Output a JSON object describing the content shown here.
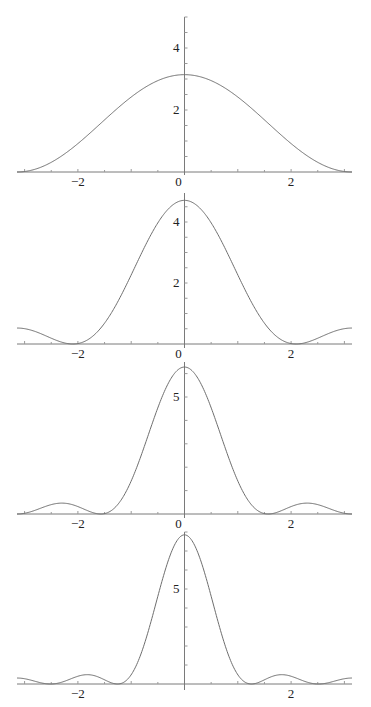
{
  "chart_data": [
    {
      "type": "line",
      "title": "",
      "xlabel": "",
      "ylabel": "",
      "n": 2,
      "peak": 3.14,
      "xlim": [
        -3.1416,
        3.1416
      ],
      "ylim": [
        0,
        5
      ],
      "xticks": [
        -2,
        0,
        2
      ],
      "xtick_labels": [
        "−2",
        "0",
        "2"
      ],
      "yticks": [
        2,
        4
      ],
      "ytick_labels": [
        "2",
        "4"
      ],
      "minor_ystep": 0.5,
      "grid": false,
      "x": [
        -3.14,
        -2.5,
        -2,
        -1.5,
        -1,
        -0.5,
        0,
        0.5,
        1,
        1.5,
        2,
        2.5,
        3.14
      ],
      "y": [
        0,
        0.3,
        0.92,
        1.86,
        2.3,
        2.96,
        3.14,
        2.96,
        2.3,
        1.86,
        0.92,
        0.3,
        0
      ]
    },
    {
      "type": "line",
      "title": "",
      "xlabel": "",
      "ylabel": "",
      "n": 3,
      "peak": 4.71,
      "xlim": [
        -3.1416,
        3.1416
      ],
      "ylim": [
        0,
        5
      ],
      "xticks": [
        -2,
        0,
        2
      ],
      "xtick_labels": [
        "−2",
        "0",
        "2"
      ],
      "yticks": [
        2,
        4
      ],
      "ytick_labels": [
        "2",
        "4"
      ],
      "minor_ystep": 0.5,
      "grid": false,
      "x": [
        -3.14,
        -2.5,
        -2.09,
        -1.5,
        -1,
        -0.5,
        0,
        0.5,
        1,
        1.5,
        2.09,
        2.5,
        3.14
      ],
      "y": [
        0.52,
        0.2,
        0,
        0.9,
        2.46,
        4.03,
        4.71,
        4.03,
        2.46,
        0.9,
        0,
        0.2,
        0.52
      ]
    },
    {
      "type": "line",
      "title": "",
      "xlabel": "",
      "ylabel": "",
      "n": 4,
      "peak": 6.28,
      "xlim": [
        -3.1416,
        3.1416
      ],
      "ylim": [
        0,
        7
      ],
      "xticks": [
        -2,
        0,
        2
      ],
      "xtick_labels": [
        "−2",
        "0",
        "2"
      ],
      "yticks": [
        5
      ],
      "ytick_labels": [
        "5"
      ],
      "minor_ystep": 1,
      "grid": false,
      "x": [
        -3.14,
        -2.36,
        -1.57,
        -1,
        -0.5,
        0,
        0.5,
        1,
        1.57,
        2.36,
        3.14
      ],
      "y": [
        0,
        0.52,
        0,
        1.85,
        4.74,
        6.28,
        4.74,
        1.85,
        0,
        0.52,
        0
      ]
    },
    {
      "type": "line",
      "title": "",
      "xlabel": "",
      "ylabel": "",
      "n": 5,
      "peak": 7.85,
      "xlim": [
        -3.1416,
        3.1416
      ],
      "ylim": [
        0,
        8
      ],
      "xticks": [
        -2,
        2
      ],
      "xtick_labels": [
        "−2",
        "2"
      ],
      "yticks": [
        5
      ],
      "ytick_labels": [
        "5"
      ],
      "minor_ystep": 1,
      "grid": false,
      "x": [
        -3.14,
        -2.51,
        -1.88,
        -1.26,
        -0.6,
        0,
        0.6,
        1.26,
        1.88,
        2.51,
        3.14
      ],
      "y": [
        0.31,
        0,
        0.47,
        0,
        3.6,
        7.85,
        3.6,
        0,
        0.47,
        0,
        0.31
      ]
    }
  ],
  "plots": [
    {
      "top": 17,
      "zeroY": 172,
      "pxPerUnit": 31.0,
      "axisTop": 17,
      "axisBottom": 175
    },
    {
      "top": 193,
      "zeroY": 344,
      "pxPerUnit": 30.5,
      "axisTop": 193,
      "axisBottom": 348
    },
    {
      "top": 362,
      "zeroY": 514,
      "pxPerUnit": 23.4,
      "axisTop": 362,
      "axisBottom": 518
    },
    {
      "top": 532,
      "zeroY": 684,
      "pxPerUnit": 19.0,
      "axisTop": 532,
      "axisBottom": 690
    }
  ],
  "layout": {
    "x0": 184.5,
    "xLeft": 17,
    "xRight": 352,
    "pxPerXUnit": 53.3
  }
}
